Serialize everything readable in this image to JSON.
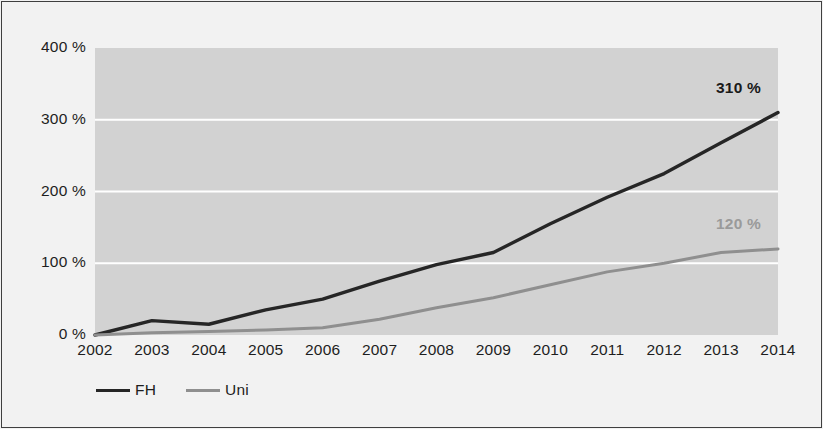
{
  "chart_data": {
    "type": "line",
    "title": "",
    "xlabel": "",
    "ylabel": "",
    "categories": [
      "2002",
      "2003",
      "2004",
      "2005",
      "2006",
      "2007",
      "2008",
      "2009",
      "2010",
      "2011",
      "2012",
      "2013",
      "2014"
    ],
    "x": [
      2002,
      2003,
      2004,
      2005,
      2006,
      2007,
      2008,
      2009,
      2010,
      2011,
      2012,
      2013,
      2014
    ],
    "ylim": [
      0,
      400
    ],
    "yticks": [
      0,
      100,
      200,
      300,
      400
    ],
    "ytick_labels": [
      "0 %",
      "100 %",
      "200 %",
      "300 %",
      "400 %"
    ],
    "grid": true,
    "gridlines_at": [
      100,
      200,
      300
    ],
    "legend_position": "bottom-left",
    "series": [
      {
        "name": "FH",
        "color": "#262626",
        "values": [
          0,
          20,
          15,
          35,
          50,
          75,
          98,
          115,
          155,
          192,
          225,
          268,
          310
        ],
        "end_label": "310 %"
      },
      {
        "name": "Uni",
        "color": "#8f8f8f",
        "values": [
          0,
          3,
          5,
          7,
          10,
          22,
          38,
          52,
          70,
          88,
          100,
          115,
          120
        ],
        "end_label": "120 %"
      }
    ],
    "annotations": [
      {
        "series": "FH",
        "text": "310 %",
        "at_category": "2014",
        "value": 310
      },
      {
        "series": "Uni",
        "text": "120 %",
        "at_category": "2014",
        "value": 120
      }
    ]
  },
  "legend": {
    "items": [
      {
        "label": "FH"
      },
      {
        "label": "Uni"
      }
    ]
  },
  "colors": {
    "fh_line": "#262626",
    "uni_line": "#8f8f8f",
    "plot_background": "#d2d2d2",
    "figure_background": "#f2f2f2",
    "gridline": "#ffffff",
    "frame": "#3f3f3f"
  }
}
